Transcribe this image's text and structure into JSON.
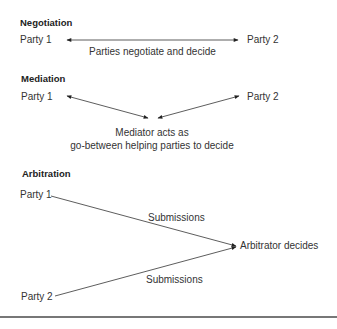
{
  "negotiation": {
    "title": "Negotiation",
    "party1": "Party 1",
    "party2": "Party 2",
    "caption": "Parties negotiate and decide"
  },
  "mediation": {
    "title": "Mediation",
    "party1": "Party 1",
    "party2": "Party 2",
    "caption_line1": "Mediator acts as",
    "caption_line2": "go-between helping parties to decide"
  },
  "arbitration": {
    "title": "Arbitration",
    "party1": "Party 1",
    "party2": "Party 2",
    "submission_top": "Submissions",
    "submission_bottom": "Submissions",
    "outcome": "Arbitrator decides"
  }
}
